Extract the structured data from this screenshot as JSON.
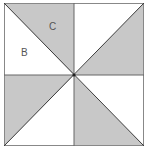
{
  "diagram": {
    "title": "",
    "shape": "square divided into 8 triangles (pinwheel)",
    "colors": {
      "shaded": "#c8c8c8",
      "unshaded": "#ffffff",
      "stroke": "#3a3a3a"
    },
    "labels": [
      {
        "text": "C",
        "region": "top-left upper triangle (shaded)"
      },
      {
        "text": "B",
        "region": "top-left lower triangle (unshaded)"
      }
    ],
    "regions": [
      {
        "quadrant": "top-left",
        "triangle": "upper",
        "shaded": true,
        "label": "C"
      },
      {
        "quadrant": "top-left",
        "triangle": "lower",
        "shaded": false,
        "label": "B"
      },
      {
        "quadrant": "top-right",
        "triangle": "upper",
        "shaded": false
      },
      {
        "quadrant": "top-right",
        "triangle": "lower",
        "shaded": true
      },
      {
        "quadrant": "bottom-left",
        "triangle": "upper",
        "shaded": true
      },
      {
        "quadrant": "bottom-left",
        "triangle": "lower",
        "shaded": false
      },
      {
        "quadrant": "bottom-right",
        "triangle": "upper",
        "shaded": false
      },
      {
        "quadrant": "bottom-right",
        "triangle": "lower",
        "shaded": true
      }
    ]
  }
}
